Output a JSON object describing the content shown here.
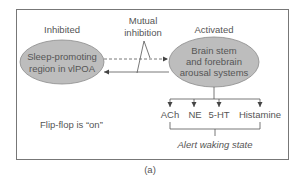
{
  "diagram": {
    "left_node": {
      "state_label": "Inhibited",
      "lines": [
        "Sleep-promoting",
        "region in vlPOA"
      ]
    },
    "right_node": {
      "state_label": "Activated",
      "lines": [
        "Brain stem",
        "and forebrain",
        "arousal systems"
      ]
    },
    "mutual_inhibition": {
      "lines": [
        "Mutual",
        "inhibition"
      ]
    },
    "flip_flop_text": "Flip-flop is “on”",
    "neurotransmitters": [
      "ACh",
      "NE",
      "5-HT",
      "Histamine"
    ],
    "outcome_text": "Alert waking state",
    "panel_label": "(a)",
    "colors": {
      "ellipse_fill": "#bdbdbd",
      "ellipse_stroke": "#8a8a8a",
      "frame": "#777777",
      "line": "#555555",
      "text": "#555555"
    }
  }
}
